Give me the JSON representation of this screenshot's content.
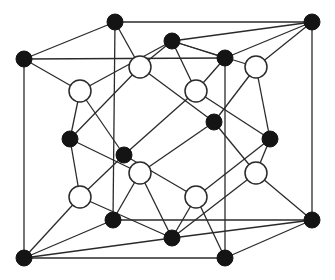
{
  "diagram": {
    "title": "",
    "type": "crystal-lattice-unit-cell",
    "colors": {
      "atom_a": "#141414",
      "atom_b_fill": "#ffffff",
      "bond": "#2a2a2a",
      "background": "#ffffff"
    },
    "atom_radius": {
      "a": 8,
      "b": 11
    },
    "atoms_a": [
      {
        "id": "A",
        "x": 115,
        "y": 22,
        "role": "corner"
      },
      {
        "id": "B",
        "x": 312,
        "y": 22,
        "role": "corner"
      },
      {
        "id": "C",
        "x": 24,
        "y": 59,
        "role": "corner"
      },
      {
        "id": "E",
        "x": 225,
        "y": 58,
        "role": "corner"
      },
      {
        "id": "J",
        "x": 113,
        "y": 220,
        "role": "corner"
      },
      {
        "id": "K",
        "x": 312,
        "y": 220,
        "role": "corner"
      },
      {
        "id": "L",
        "x": 24,
        "y": 258,
        "role": "corner"
      },
      {
        "id": "N",
        "x": 225,
        "y": 258,
        "role": "corner"
      },
      {
        "id": "D",
        "x": 172,
        "y": 41,
        "role": "face-center-top"
      },
      {
        "id": "M",
        "x": 172,
        "y": 238,
        "role": "face-center-bottom"
      },
      {
        "id": "F",
        "x": 70,
        "y": 139,
        "role": "face-center-left"
      },
      {
        "id": "H",
        "x": 270,
        "y": 139,
        "role": "face-center-right"
      },
      {
        "id": "G",
        "x": 214,
        "y": 122,
        "role": "face-center-back"
      },
      {
        "id": "I",
        "x": 124,
        "y": 155,
        "role": "face-center-front"
      }
    ],
    "atoms_b": [
      {
        "id": "W1",
        "x": 80,
        "y": 91
      },
      {
        "id": "W2",
        "x": 140,
        "y": 67
      },
      {
        "id": "W3",
        "x": 256,
        "y": 67
      },
      {
        "id": "W4",
        "x": 196,
        "y": 91
      },
      {
        "id": "W5",
        "x": 140,
        "y": 173
      },
      {
        "id": "W6",
        "x": 80,
        "y": 197
      },
      {
        "id": "W7",
        "x": 196,
        "y": 197
      },
      {
        "id": "W8",
        "x": 256,
        "y": 173
      }
    ],
    "bonds": [
      [
        "A",
        "B"
      ],
      [
        "C",
        "E"
      ],
      [
        "A",
        "C"
      ],
      [
        "B",
        "E"
      ],
      [
        "J",
        "K"
      ],
      [
        "L",
        "N"
      ],
      [
        "J",
        "L"
      ],
      [
        "K",
        "N"
      ],
      [
        "A",
        "J"
      ],
      [
        "B",
        "K"
      ],
      [
        "C",
        "L"
      ],
      [
        "E",
        "N"
      ],
      [
        "D",
        "E"
      ],
      [
        "D",
        "B"
      ],
      [
        "M",
        "L"
      ],
      [
        "M",
        "K"
      ],
      [
        "W1",
        "C"
      ],
      [
        "W1",
        "D"
      ],
      [
        "W1",
        "F"
      ],
      [
        "W1",
        "I"
      ],
      [
        "W2",
        "A"
      ],
      [
        "W2",
        "D"
      ],
      [
        "W2",
        "F"
      ],
      [
        "W2",
        "G"
      ],
      [
        "W3",
        "B"
      ],
      [
        "W3",
        "D"
      ],
      [
        "W3",
        "H"
      ],
      [
        "W3",
        "G"
      ],
      [
        "W4",
        "E"
      ],
      [
        "W4",
        "D"
      ],
      [
        "W4",
        "H"
      ],
      [
        "W4",
        "I"
      ],
      [
        "W5",
        "J"
      ],
      [
        "W5",
        "M"
      ],
      [
        "W5",
        "F"
      ],
      [
        "W5",
        "G"
      ],
      [
        "W6",
        "L"
      ],
      [
        "W6",
        "M"
      ],
      [
        "W6",
        "F"
      ],
      [
        "W6",
        "I"
      ],
      [
        "W7",
        "N"
      ],
      [
        "W7",
        "M"
      ],
      [
        "W7",
        "H"
      ],
      [
        "W7",
        "I"
      ],
      [
        "W8",
        "K"
      ],
      [
        "W8",
        "M"
      ],
      [
        "W8",
        "H"
      ],
      [
        "W8",
        "G"
      ]
    ]
  }
}
